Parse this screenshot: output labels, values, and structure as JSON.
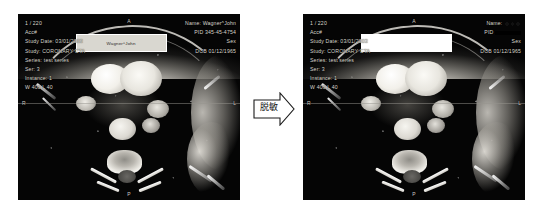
{
  "annotation": {
    "arrow_label": "脱敏",
    "arrow_icon": "right-arrow-icon"
  },
  "panels": [
    {
      "id": "before",
      "role": "original-dicom-image",
      "orientation": {
        "top": "A",
        "left": "R",
        "right": "L",
        "bottom": "P"
      },
      "burned_in_annotation": {
        "text": "Wagner^John",
        "redacted": false
      },
      "overlay_left": [
        "1 / 220",
        "Acc#",
        "Study Date: 03/01/2003",
        "Study: CORONARY CTA",
        "Series: test series",
        "Ser: 3",
        "Instance: 1",
        "W 400 L 40"
      ],
      "overlay_right": [
        {
          "label": "Name:",
          "value": "Wagner^John",
          "redacted": false
        },
        {
          "label": "PID",
          "value": "345-45-4754",
          "redacted": false
        },
        {
          "label": "",
          "value": "Sex",
          "redacted": false
        },
        {
          "label": "DOB",
          "value": "01/12/1965",
          "redacted": false
        }
      ]
    },
    {
      "id": "after",
      "role": "de-identified-dicom-image",
      "orientation": {
        "top": "A",
        "left": "R",
        "right": "L",
        "bottom": "P"
      },
      "burned_in_annotation": {
        "text": "",
        "redacted": true
      },
      "overlay_left": [
        "1 / 220",
        "Acc#",
        "Study Date: 03/01/2003",
        "Study: CORONARY CTA",
        "Series: test series",
        "Ser: 3",
        "Instance: 1",
        "W 400 L 40"
      ],
      "overlay_right": [
        {
          "label": "Name:",
          "value": "",
          "redacted": true
        },
        {
          "label": "PID",
          "value": "",
          "redacted": true
        },
        {
          "label": "",
          "value": "Sex",
          "redacted": false
        },
        {
          "label": "DOB",
          "value": "01/12/1965",
          "redacted": false
        }
      ]
    }
  ]
}
